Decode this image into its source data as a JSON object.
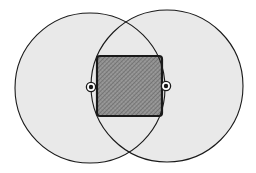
{
  "diagram": {
    "background": "#ffffff",
    "circle_fill": "#e9e9e9",
    "stroke_color": "#1a1a1a",
    "square_fill": "#8c8c8c",
    "circles": [
      {
        "id": "left",
        "cx": 90,
        "cy": 88,
        "r": 75
      },
      {
        "id": "right",
        "cx": 167,
        "cy": 86,
        "r": 76
      }
    ],
    "square": {
      "x": 97,
      "y": 56,
      "width": 65,
      "height": 60,
      "rx": 3
    },
    "center_markers": [
      {
        "id": "left-center",
        "cx": 91,
        "cy": 87
      },
      {
        "id": "right-center",
        "cx": 166,
        "cy": 86
      }
    ]
  }
}
